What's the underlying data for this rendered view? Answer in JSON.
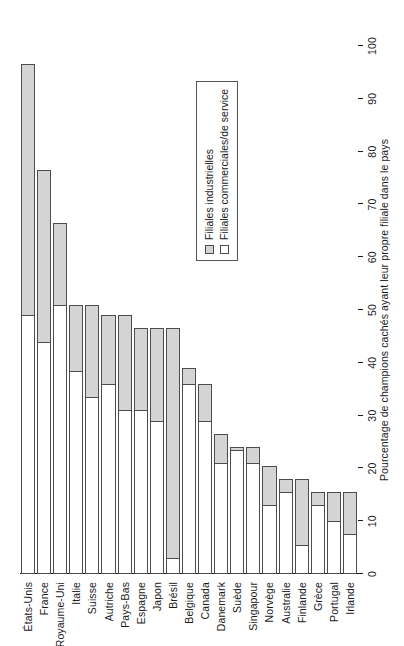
{
  "chart_data": {
    "type": "bar",
    "orientation": "horizontal",
    "stacked": true,
    "title": "",
    "xlabel": "Pourcentage de champions cachés ayant leur propre filiale dans le pays",
    "ylabel": "",
    "xlim": [
      0,
      100
    ],
    "xticks": [
      0,
      10,
      20,
      30,
      40,
      50,
      60,
      70,
      80,
      90,
      100
    ],
    "grid": false,
    "legend_position": "upper-right",
    "categories": [
      "États-Unis",
      "France",
      "Royaume-Uni",
      "Italie",
      "Suisse",
      "Autriche",
      "Pays-Bas",
      "Espagne",
      "Japon",
      "Brésil",
      "Belgique",
      "Canada",
      "Danemark",
      "Suède",
      "Singapour",
      "Norvège",
      "Australie",
      "Finlande",
      "Grèce",
      "Portugal",
      "Irlande"
    ],
    "series": [
      {
        "name": "Filiales commerciales/de service",
        "color": "#ffffff",
        "values": [
          49,
          44,
          51,
          38.5,
          33.5,
          36,
          31,
          31,
          29,
          3,
          36,
          29,
          21,
          23.5,
          21,
          13,
          15.5,
          5.5,
          13,
          10,
          7.5
        ]
      },
      {
        "name": "Filiales industrielles",
        "color": "#d4d4d4",
        "values": [
          47.5,
          32.5,
          15.5,
          12.5,
          17.5,
          13,
          18,
          15.5,
          17.5,
          43.5,
          3,
          7,
          5.5,
          0.5,
          3,
          7.5,
          2.5,
          12.5,
          2.5,
          5.5,
          8
        ]
      }
    ],
    "totals": [
      96.5,
      76.5,
      66.5,
      51,
      51,
      49,
      49,
      46.5,
      46.5,
      46.5,
      39,
      36,
      26.5,
      24,
      24,
      20.5,
      18,
      18,
      15.5,
      15.5,
      15.5
    ]
  },
  "legend": {
    "items": [
      {
        "label": "Filiales industrielles",
        "swatch": "industrial"
      },
      {
        "label": "Filiales commerciales/de service",
        "swatch": "commercial"
      }
    ]
  }
}
